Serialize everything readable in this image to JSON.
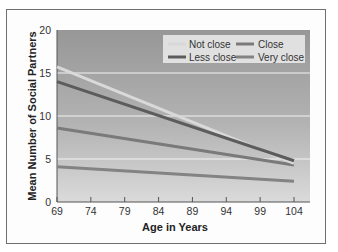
{
  "chart_data": {
    "type": "line",
    "title": "",
    "xlabel": "Age in Years",
    "ylabel": "Mean Number of Social Partners",
    "x": [
      69,
      104
    ],
    "xticks": [
      "69",
      "74",
      "79",
      "84",
      "89",
      "94",
      "99",
      "104"
    ],
    "yticks": [
      "0",
      "5",
      "10",
      "15",
      "20"
    ],
    "xlim": [
      69,
      104
    ],
    "ylim": [
      0,
      20
    ],
    "grid": "horizontal",
    "legend_position": "top-right",
    "series": [
      {
        "name": "Not close",
        "values": [
          15.7,
          4.5
        ],
        "color": "#d9d9d9"
      },
      {
        "name": "Less close",
        "values": [
          14.0,
          4.8
        ],
        "color": "#5c5c5c"
      },
      {
        "name": "Close",
        "values": [
          8.6,
          4.3
        ],
        "color": "#7a7a7a"
      },
      {
        "name": "Very close",
        "values": [
          4.1,
          2.4
        ],
        "color": "#838383"
      }
    ]
  },
  "legend": {
    "items": [
      {
        "label": "Not close"
      },
      {
        "label": "Close"
      },
      {
        "label": "Less close"
      },
      {
        "label": "Very close"
      }
    ]
  }
}
